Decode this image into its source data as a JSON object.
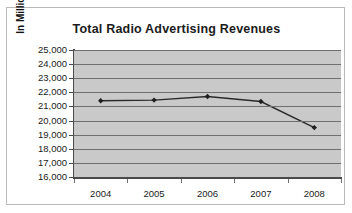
{
  "chart_data": {
    "type": "line",
    "title": "Total Radio Advertising Revenues",
    "xlabel": "",
    "ylabel": "In Millions of $",
    "categories": [
      "2004",
      "2005",
      "2006",
      "2007",
      "2008"
    ],
    "values": [
      21400,
      21450,
      21700,
      21350,
      19500
    ],
    "series": [
      {
        "name": "Total Radio Advertising Revenues",
        "values": [
          21400,
          21450,
          21700,
          21350,
          19500
        ]
      }
    ],
    "ylim": [
      16000,
      25000
    ],
    "ytick_step": 1000,
    "ytick_labels": [
      "25,000",
      "24,000",
      "23,000",
      "22,000",
      "21,000",
      "20,000",
      "19,000",
      "18,000",
      "17,000",
      "16,000"
    ],
    "ytick_values": [
      25000,
      24000,
      23000,
      22000,
      21000,
      20000,
      19000,
      18000,
      17000,
      16000
    ],
    "grid": true,
    "legend": "none",
    "plot_background_color": "#c9c9c9",
    "line_color": "#2a2a2a",
    "marker": "diamond"
  }
}
